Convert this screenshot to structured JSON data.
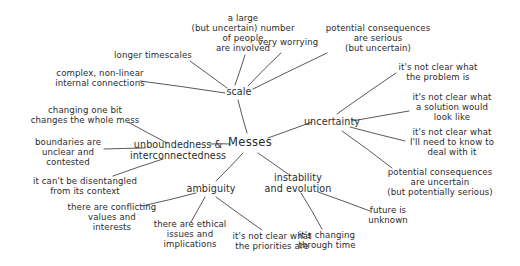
{
  "diagram": {
    "title": "Messes",
    "style": {
      "background": "#ffffff",
      "ink": "#2b2b2b",
      "line": "#3a3a3a"
    },
    "root": {
      "label": "Messes",
      "x": 250,
      "y": 143
    },
    "branches": [
      {
        "id": "scale",
        "label": "scale",
        "x": 239,
        "y": 92
      },
      {
        "id": "uncertainty",
        "label": "uncertainty",
        "x": 332,
        "y": 122
      },
      {
        "id": "unboundedness",
        "label": "unboundedness &\ninterconnectedness",
        "x": 178,
        "y": 150
      },
      {
        "id": "ambiguity",
        "label": "ambiguity",
        "x": 211,
        "y": 189
      },
      {
        "id": "instability",
        "label": "instability\nand evolution",
        "x": 298,
        "y": 183
      }
    ],
    "leaves": [
      {
        "id": "large-number",
        "parent": "scale",
        "label": "a large\n(but uncertain) number\nof people\nare involved",
        "x": 243,
        "y": 33
      },
      {
        "id": "very-worrying",
        "parent": "scale",
        "label": "very worrying",
        "x": 288,
        "y": 42
      },
      {
        "id": "consequences-serious",
        "parent": "scale",
        "label": "potential consequences\nare serious\n(but uncertain)",
        "x": 378,
        "y": 38
      },
      {
        "id": "longer-timescales",
        "parent": "scale",
        "label": "longer timescales",
        "x": 153,
        "y": 55
      },
      {
        "id": "complex-nonlinear",
        "parent": "scale",
        "label": "complex, non-linear\ninternal connections",
        "x": 100,
        "y": 78
      },
      {
        "id": "unclear-problem",
        "parent": "uncertainty",
        "label": "it's not clear what\nthe problem is",
        "x": 438,
        "y": 72
      },
      {
        "id": "unclear-solution",
        "parent": "uncertainty",
        "label": "it's not clear what\na solution would\nlook like",
        "x": 452,
        "y": 107
      },
      {
        "id": "unclear-need-to-know",
        "parent": "uncertainty",
        "label": "it's not clear what\nI'll need to know to\ndeal with it",
        "x": 452,
        "y": 142
      },
      {
        "id": "consequences-uncertain",
        "parent": "uncertainty",
        "label": "potential consequences\nare uncertain\n(but potentially serious)",
        "x": 440,
        "y": 182
      },
      {
        "id": "changing-one-bit",
        "parent": "unboundedness",
        "label": "changing one bit\nchanges the whole mess",
        "x": 85,
        "y": 115
      },
      {
        "id": "boundaries-unclear",
        "parent": "unboundedness",
        "label": "boundaries are\nunclear and\ncontested",
        "x": 68,
        "y": 152
      },
      {
        "id": "cant-disentangle",
        "parent": "unboundedness",
        "label": "it can't be disentangled\nfrom its context",
        "x": 85,
        "y": 186
      },
      {
        "id": "conflicting-values",
        "parent": "ambiguity",
        "label": "there are conflicting\nvalues and\ninterests",
        "x": 112,
        "y": 217
      },
      {
        "id": "ethical-issues",
        "parent": "ambiguity",
        "label": "there are ethical\nissues and\nimplications",
        "x": 190,
        "y": 234
      },
      {
        "id": "unclear-priorities",
        "parent": "ambiguity",
        "label": "it's not clear what\nthe priorities are",
        "x": 272,
        "y": 241
      },
      {
        "id": "changing-through-time",
        "parent": "instability",
        "label": "it's changing\nthrough time",
        "x": 327,
        "y": 240
      },
      {
        "id": "future-unknown",
        "parent": "instability",
        "label": "future is\nunknown",
        "x": 388,
        "y": 215
      }
    ],
    "edges": [
      {
        "from": "root",
        "to": "scale",
        "x1": 247,
        "y1": 133,
        "x2": 238,
        "y2": 100
      },
      {
        "from": "root",
        "to": "uncertainty",
        "x1": 268,
        "y1": 138,
        "x2": 312,
        "y2": 122
      },
      {
        "from": "root",
        "to": "unboundedness",
        "x1": 230,
        "y1": 144,
        "x2": 210,
        "y2": 144
      },
      {
        "from": "root",
        "to": "ambiguity",
        "x1": 243,
        "y1": 153,
        "x2": 216,
        "y2": 181
      },
      {
        "from": "root",
        "to": "instability",
        "x1": 258,
        "y1": 153,
        "x2": 288,
        "y2": 174
      },
      {
        "from": "scale",
        "to": "large-number",
        "x1": 235,
        "y1": 85,
        "x2": 245,
        "y2": 55
      },
      {
        "from": "scale",
        "to": "very-worrying",
        "x1": 248,
        "y1": 86,
        "x2": 281,
        "y2": 53
      },
      {
        "from": "scale",
        "to": "consequences-serious",
        "x1": 253,
        "y1": 89,
        "x2": 327,
        "y2": 53
      },
      {
        "from": "scale",
        "to": "longer-timescales",
        "x1": 227,
        "y1": 88,
        "x2": 190,
        "y2": 61
      },
      {
        "from": "scale",
        "to": "complex-nonlinear",
        "x1": 225,
        "y1": 93,
        "x2": 140,
        "y2": 81
      },
      {
        "from": "uncertainty",
        "to": "unclear-problem",
        "x1": 337,
        "y1": 114,
        "x2": 396,
        "y2": 73
      },
      {
        "from": "uncertainty",
        "to": "unclear-solution",
        "x1": 352,
        "y1": 121,
        "x2": 409,
        "y2": 111
      },
      {
        "from": "uncertainty",
        "to": "unclear-need-to-know",
        "x1": 350,
        "y1": 127,
        "x2": 405,
        "y2": 141
      },
      {
        "from": "uncertainty",
        "to": "consequences-uncertain",
        "x1": 342,
        "y1": 131,
        "x2": 392,
        "y2": 168
      },
      {
        "from": "unboundedness",
        "to": "changing-one-bit",
        "x1": 167,
        "y1": 143,
        "x2": 128,
        "y2": 122
      },
      {
        "from": "unboundedness",
        "to": "boundaries-unclear",
        "x1": 145,
        "y1": 148,
        "x2": 104,
        "y2": 149
      },
      {
        "from": "unboundedness",
        "to": "cant-disentangled",
        "x1": 163,
        "y1": 159,
        "x2": 113,
        "y2": 176
      },
      {
        "from": "ambiguity",
        "to": "conflicting-values",
        "x1": 196,
        "y1": 193,
        "x2": 142,
        "y2": 206
      },
      {
        "from": "ambiguity",
        "to": "ethical-issues",
        "x1": 205,
        "y1": 197,
        "x2": 191,
        "y2": 222
      },
      {
        "from": "ambiguity",
        "to": "unclear-priorities",
        "x1": 216,
        "y1": 197,
        "x2": 262,
        "y2": 230
      },
      {
        "from": "instability",
        "to": "changing-through-time",
        "x1": 301,
        "y1": 193,
        "x2": 322,
        "y2": 229
      },
      {
        "from": "instability",
        "to": "future-unknown",
        "x1": 318,
        "y1": 192,
        "x2": 370,
        "y2": 211
      }
    ]
  }
}
